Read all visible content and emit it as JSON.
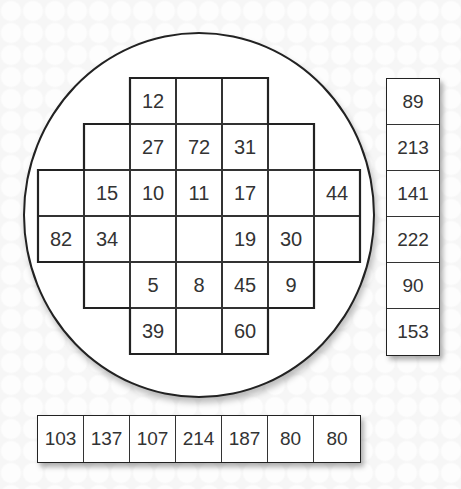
{
  "wafer": {
    "origin": {
      "x": 38,
      "y": 78
    },
    "cell_size": 46,
    "rows": [
      {
        "start_col": 2,
        "cells": [
          "12",
          "",
          ""
        ]
      },
      {
        "start_col": 1,
        "cells": [
          "",
          "27",
          "72",
          "31",
          ""
        ]
      },
      {
        "start_col": 0,
        "cells": [
          "",
          "15",
          "10",
          "11",
          "17",
          "",
          "44"
        ]
      },
      {
        "start_col": 0,
        "cells": [
          "82",
          "34",
          "",
          "",
          "19",
          "30",
          ""
        ]
      },
      {
        "start_col": 1,
        "cells": [
          "",
          "5",
          "8",
          "45",
          "9"
        ]
      },
      {
        "start_col": 2,
        "cells": [
          "39",
          "",
          "60"
        ]
      }
    ]
  },
  "row_sums": [
    "89",
    "213",
    "141",
    "222",
    "90",
    "153"
  ],
  "column_sums": [
    "103",
    "137",
    "107",
    "214",
    "187",
    "80",
    "80"
  ],
  "colors": {
    "background": "#f6f6f6",
    "line": "#222222",
    "text": "#333333",
    "cell": "#ffffff"
  }
}
